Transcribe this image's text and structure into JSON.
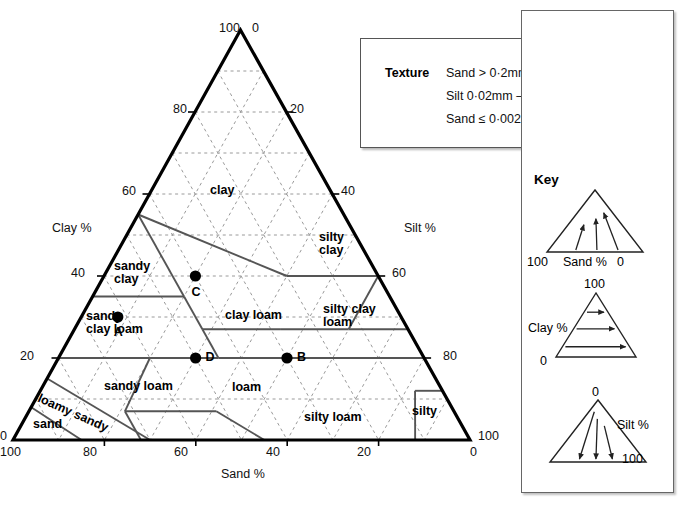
{
  "diagram": {
    "type": "soil-texture-triangle",
    "title_none": ""
  },
  "triangle": {
    "apex_left_label": "100",
    "apex_right_label": "0",
    "bottom_left_clay": "0",
    "bottom_left_sand": "100",
    "bottom_right_silt": "100",
    "bottom_right_sand": "0",
    "clay_axis_title": "Clay %",
    "silt_axis_title": "Silt %",
    "sand_axis_title": "Sand %",
    "clay_ticks": [
      "20",
      "40",
      "60",
      "80"
    ],
    "silt_ticks": [
      "20",
      "40",
      "60",
      "80"
    ],
    "sand_ticks": [
      "80",
      "60",
      "40",
      "20"
    ]
  },
  "regions": [
    {
      "id": "clay",
      "label": "clay"
    },
    {
      "id": "silty-clay",
      "label": "silty\nclay",
      "line1": "silty",
      "line2": "clay"
    },
    {
      "id": "sandy-clay",
      "label": "sandy clay",
      "line1": "sandy",
      "line2": "clay"
    },
    {
      "id": "sandy-clay-loam",
      "label": "sandy clay loam",
      "line1": "sandy",
      "line2": "clay loam"
    },
    {
      "id": "clay-loam",
      "label": "clay loam"
    },
    {
      "id": "silty-clay-loam",
      "label": "silty clay loam",
      "line1": "silty clay",
      "line2": "loam"
    },
    {
      "id": "sandy-loam",
      "label": "sandy loam"
    },
    {
      "id": "loam",
      "label": "loam"
    },
    {
      "id": "silty-loam",
      "label": "silty loam"
    },
    {
      "id": "loamy-sandy",
      "label": "loamy sandy"
    },
    {
      "id": "sand",
      "label": "sand"
    },
    {
      "id": "silty",
      "label": "silty"
    }
  ],
  "points": [
    {
      "label": "A",
      "clay": 30,
      "sand": 62,
      "silt": 8
    },
    {
      "label": "B",
      "clay": 20,
      "sand": 30,
      "silt": 50
    },
    {
      "label": "C",
      "clay": 40,
      "sand": 40,
      "silt": 20
    },
    {
      "label": "D",
      "clay": 20,
      "sand": 50,
      "silt": 30
    }
  ],
  "texture_box": {
    "heading": "Texture",
    "lines": [
      "Sand > 0·2mm",
      "Silt 0·02mm – 0·2mm",
      "Sand ≤ 0·002mm"
    ]
  },
  "key": {
    "title": "Key",
    "panels": [
      {
        "id": "key-sand",
        "axis_label": "Sand %",
        "left_value": "100",
        "right_value": "0",
        "direction": "arrows-up-left",
        "arrow_count": 3
      },
      {
        "id": "key-clay",
        "axis_label": "Clay %",
        "top_value": "100",
        "bottom_value": "0",
        "direction": "arrows-right",
        "arrow_count": 3
      },
      {
        "id": "key-silt",
        "axis_label": "Silt %",
        "top_value": "0",
        "bottom_value": "100",
        "direction": "arrows-down-left",
        "arrow_count": 3
      }
    ]
  },
  "colors": {
    "outline": "#000000",
    "grid": "#9a9a9a",
    "boundary": "#555555",
    "panel_border": "#666666",
    "point_fill": "#000000"
  }
}
